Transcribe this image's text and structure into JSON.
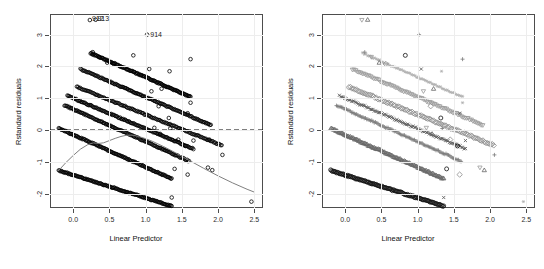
{
  "figure": {
    "type": "scatter-panel-pair",
    "background": "#ffffff",
    "panel_count": 2
  },
  "axes": {
    "x_title": "Linear Predictor",
    "y_title": "Rstandard residuals",
    "x_ticks": [
      "0.0",
      "0.5",
      "1.0",
      "1.5",
      "2.0",
      "2.5"
    ],
    "y_ticks": [
      "3",
      "2",
      "1",
      "0",
      "-1",
      "-2"
    ],
    "x_tick_values": [
      0.0,
      0.5,
      1.0,
      1.5,
      2.0,
      2.5
    ],
    "y_tick_values": [
      3,
      2,
      1,
      0,
      -1,
      -2
    ],
    "x_limits": [
      -0.32,
      2.62
    ],
    "y_limits": [
      -2.45,
      3.65
    ],
    "grid_color": "#ededed",
    "frame_color": "#4d4d4d",
    "tick_label_color": "#2b2b2b"
  },
  "annotations": {
    "outlier_labels": [
      {
        "text": "912",
        "x": 0.225,
        "y": 3.48
      },
      {
        "text": "913",
        "x": 0.3,
        "y": 3.5
      },
      {
        "text": "914",
        "x": 1.03,
        "y": 3.0
      }
    ]
  },
  "chart_data": {
    "type": "scatter",
    "title": "",
    "xlabel": "Linear Predictor",
    "ylabel": "Rstandard residuals",
    "xlim": [
      -0.32,
      2.62
    ],
    "ylim": [
      -2.45,
      3.65
    ],
    "grid": true,
    "legend": "none",
    "reference_lines": [
      {
        "name": "zero-line",
        "orientation": "horizontal",
        "y": 0,
        "style": "dashed",
        "color": "#000000",
        "panel": "left"
      }
    ],
    "smoother": {
      "name": "lowess-smoother",
      "panel": "left",
      "color": "#808080",
      "style": "solid",
      "points": [
        [
          -0.2,
          -1.27
        ],
        [
          -0.1,
          -1.02
        ],
        [
          0.0,
          -0.8
        ],
        [
          0.1,
          -0.6
        ],
        [
          0.2,
          -0.46
        ],
        [
          0.28,
          -0.4
        ],
        [
          0.35,
          -0.42
        ],
        [
          0.42,
          -0.4
        ],
        [
          0.5,
          -0.33
        ],
        [
          0.58,
          -0.26
        ],
        [
          0.66,
          -0.2
        ],
        [
          0.74,
          -0.16
        ],
        [
          0.82,
          -0.16
        ],
        [
          0.9,
          -0.2
        ],
        [
          1.0,
          -0.27
        ],
        [
          1.1,
          -0.36
        ],
        [
          1.25,
          -0.52
        ],
        [
          1.4,
          -0.7
        ],
        [
          1.6,
          -0.95
        ],
        [
          1.8,
          -1.2
        ],
        [
          2.0,
          -1.44
        ],
        [
          2.2,
          -1.66
        ],
        [
          2.4,
          -1.86
        ],
        [
          2.5,
          -1.95
        ]
      ]
    },
    "panels": [
      {
        "name": "left-panel",
        "symbol_mode": "uniform",
        "symbol": "open-circle",
        "color": "#000000",
        "description": "All residuals plotted with identical open circles"
      },
      {
        "name": "right-panel",
        "symbol_mode": "grouped",
        "description": "Residuals plotted with group-specific symbols and gray levels",
        "groups": [
          {
            "name": "group-1",
            "symbol": "circle",
            "color": "#111111",
            "intercept": -1.27,
            "slope": -0.72,
            "x_start": -0.2,
            "x_end": 1.36,
            "n": 120
          },
          {
            "name": "group-2",
            "symbol": "triangle-up",
            "color": "#666666",
            "intercept": 0.06,
            "slope": -1.02,
            "x_start": -0.2,
            "x_end": 1.36,
            "n": 110
          },
          {
            "name": "group-3",
            "symbol": "plus",
            "color": "#7a7a7a",
            "intercept": 0.78,
            "slope": -1.02,
            "x_start": -0.12,
            "x_end": 1.6,
            "n": 100
          },
          {
            "name": "group-4",
            "symbol": "x-cross",
            "color": "#555555",
            "intercept": 1.08,
            "slope": -0.96,
            "x_start": -0.08,
            "x_end": 1.66,
            "n": 95
          },
          {
            "name": "group-5",
            "symbol": "diamond",
            "color": "#8c8c8c",
            "intercept": 1.36,
            "slope": -0.92,
            "x_start": 0.05,
            "x_end": 2.05,
            "n": 95
          },
          {
            "name": "group-6",
            "symbol": "triangle-down",
            "color": "#999999",
            "intercept": 1.92,
            "slope": -0.98,
            "x_start": 0.1,
            "x_end": 1.9,
            "n": 80
          },
          {
            "name": "group-7",
            "symbol": "asterisk",
            "color": "#b0b0b0",
            "intercept": 2.42,
            "slope": -1.0,
            "x_start": 0.24,
            "x_end": 1.62,
            "n": 60
          }
        ]
      }
    ],
    "bands": [
      {
        "name": "band-1",
        "intercept": -1.27,
        "slope": -0.72,
        "x_start": -0.2,
        "x_end": 1.36
      },
      {
        "name": "band-2",
        "intercept": 0.06,
        "slope": -1.02,
        "x_start": -0.2,
        "x_end": 1.36
      },
      {
        "name": "band-3",
        "intercept": 0.78,
        "slope": -1.02,
        "x_start": -0.12,
        "x_end": 1.6
      },
      {
        "name": "band-4",
        "intercept": 1.08,
        "slope": -0.96,
        "x_start": -0.08,
        "x_end": 1.66
      },
      {
        "name": "band-5",
        "intercept": 1.36,
        "slope": -0.92,
        "x_start": 0.05,
        "x_end": 2.05
      },
      {
        "name": "band-6",
        "intercept": 1.92,
        "slope": -0.98,
        "x_start": 0.1,
        "x_end": 1.9
      },
      {
        "name": "band-7",
        "intercept": 2.42,
        "slope": -1.0,
        "x_start": 0.24,
        "x_end": 1.62
      }
    ],
    "scatter_extra": [
      [
        0.27,
        2.45
      ],
      [
        0.36,
        2.3
      ],
      [
        0.47,
        2.12
      ],
      [
        0.56,
        2.08
      ],
      [
        0.83,
        2.35
      ],
      [
        1.05,
        1.92
      ],
      [
        1.33,
        1.85
      ],
      [
        1.62,
        2.23
      ],
      [
        1.08,
        1.22
      ],
      [
        1.22,
        1.3
      ],
      [
        1.18,
        0.75
      ],
      [
        1.32,
        0.38
      ],
      [
        1.58,
        0.53
      ],
      [
        1.62,
        0.86
      ],
      [
        1.34,
        0.05
      ],
      [
        1.12,
        0.07
      ],
      [
        1.2,
        -0.12
      ],
      [
        1.45,
        -0.3
      ],
      [
        1.55,
        -0.5
      ],
      [
        1.66,
        -0.33
      ],
      [
        1.88,
        -0.3
      ],
      [
        2.06,
        -0.78
      ],
      [
        1.86,
        -1.18
      ],
      [
        1.92,
        -1.26
      ],
      [
        1.58,
        -1.4
      ],
      [
        1.4,
        -1.22
      ],
      [
        1.36,
        -2.12
      ],
      [
        2.46,
        -2.25
      ],
      [
        1.02,
        3.0
      ],
      [
        0.23,
        3.46
      ],
      [
        0.31,
        3.47
      ]
    ]
  }
}
